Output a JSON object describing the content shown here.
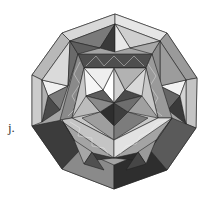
{
  "figure": {
    "label": "j.",
    "palette": {
      "white": "#f4f4f4",
      "light": "#d0d0d0",
      "mid": "#a4a4a4",
      "midDark": "#7c7c7c",
      "dark": "#555555",
      "darkest": "#2e2e2e",
      "edge": "#222222"
    }
  }
}
